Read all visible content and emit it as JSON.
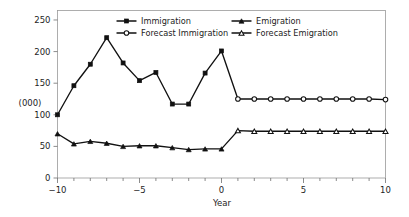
{
  "chart_data": {
    "type": "line",
    "title": "",
    "xlabel": "Year",
    "ylabel": "(000)",
    "xlim": [
      -10,
      10
    ],
    "ylim": [
      0,
      265
    ],
    "grid": false,
    "legend_position": "top-center",
    "x_ticks": [
      -10,
      -5,
      0,
      5,
      10
    ],
    "x_tick_labels": [
      "−10",
      "−5",
      "0",
      "5",
      "10"
    ],
    "x_minor_ticks": [
      -9,
      -8,
      -7,
      -6,
      -4,
      -3,
      -2,
      -1,
      1,
      2,
      3,
      4,
      6,
      7,
      8,
      9
    ],
    "y_ticks": [
      0,
      50,
      100,
      150,
      200,
      250
    ],
    "y_tick_labels": [
      "0",
      "50",
      "100",
      "150",
      "200",
      "250"
    ],
    "series": [
      {
        "name": "Immigration",
        "marker": "filled-square",
        "x": [
          -10,
          -9,
          -8,
          -7,
          -6,
          -5,
          -4,
          -3,
          -2,
          -1,
          0
        ],
        "values": [
          100,
          146,
          180,
          222,
          182,
          154,
          167,
          117,
          117,
          166,
          201
        ]
      },
      {
        "name": "Forecast Immigration",
        "marker": "open-circle",
        "x": [
          0,
          1,
          2,
          3,
          4,
          5,
          6,
          7,
          8,
          9,
          10
        ],
        "values": [
          201,
          125,
          125,
          125,
          125,
          125,
          125,
          125,
          125,
          125,
          124
        ]
      },
      {
        "name": "Emigration",
        "marker": "filled-triangle",
        "x": [
          -10,
          -9,
          -8,
          -7,
          -6,
          -5,
          -4,
          -3,
          -2,
          -1,
          0
        ],
        "values": [
          70,
          54,
          58,
          55,
          50,
          51,
          51,
          48,
          45,
          46,
          46
        ]
      },
      {
        "name": "Forecast Emigration",
        "marker": "open-triangle",
        "x": [
          0,
          1,
          2,
          3,
          4,
          5,
          6,
          7,
          8,
          9,
          10
        ],
        "values": [
          46,
          75,
          74,
          74,
          74,
          74,
          74,
          74,
          74,
          74,
          74
        ]
      }
    ],
    "colors": {
      "line": "#111111",
      "frame": "#9a9a9a",
      "text": "#1d1d1d",
      "background": "#ffffff"
    }
  },
  "legend": {
    "entries": [
      {
        "label": "Immigration"
      },
      {
        "label": "Emigration"
      },
      {
        "label": "Forecast Immigration"
      },
      {
        "label": "Forecast Emigration"
      }
    ]
  },
  "axes": {
    "x_title": "Year",
    "y_title": "(000)"
  }
}
